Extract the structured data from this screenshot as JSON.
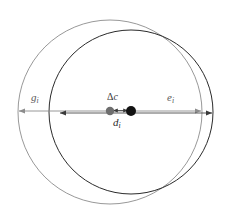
{
  "figure": {
    "kind": "geometry-diagram",
    "background_color": "#ffffff"
  },
  "colors": {
    "outer_circle_stroke": "#8c8c8c",
    "inner_circle_stroke": "#2b2b2b",
    "outer_axis_stroke": "#8c8c8c",
    "inner_axis_stroke": "#4a4a4a",
    "outer_center_dot": "#6e6e6e",
    "inner_center_dot": "#121212",
    "delta_arrow": "#3a3a3a"
  },
  "shapes": {
    "outer_circle": {
      "name": "gravity-circle",
      "cx": 110,
      "cy": 112,
      "r": 92,
      "stroke_width": 0.9
    },
    "inner_circle": {
      "name": "extent-circle",
      "cx": 131,
      "cy": 112,
      "r": 82,
      "stroke_width": 1.0
    }
  },
  "markers": {
    "outer_center": {
      "cx": 110,
      "cy": 111,
      "r": 4.2
    },
    "inner_center": {
      "cx": 131,
      "cy": 111,
      "r": 5.0
    }
  },
  "axes": {
    "outer_span": {
      "name": "g-e-axis",
      "x1": 18,
      "x2": 202,
      "y": 111
    },
    "inner_span": {
      "name": "d-axis",
      "x1": 59,
      "x2": 213,
      "y": 113
    },
    "delta_span": {
      "name": "delta-c-axis",
      "x1": 110,
      "x2": 131,
      "y": 111
    }
  },
  "labels": {
    "g": {
      "base": "g",
      "sub": "i"
    },
    "e": {
      "base": "e",
      "sub": "i"
    },
    "delta_c": {
      "delta": "Δ",
      "base": "c"
    },
    "d": {
      "base": "d",
      "sub": "i"
    }
  }
}
